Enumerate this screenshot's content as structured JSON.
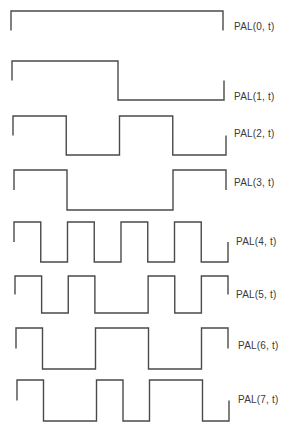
{
  "figure": {
    "background": "#ffffff",
    "line_color": "#4a4a4a",
    "label_color": "#3a3a3a"
  },
  "waveforms": [
    {
      "label": "PAL(0, t)",
      "bits": [
        1,
        1,
        1,
        1,
        1,
        1,
        1,
        1
      ],
      "x0": 11,
      "x1": 223,
      "high": 11,
      "low": 50,
      "label_x": 234,
      "label_y": 21
    },
    {
      "label": "PAL(1, t)",
      "bits": [
        1,
        1,
        1,
        1,
        -1,
        -1,
        -1,
        -1
      ],
      "x0": 12,
      "x1": 224,
      "high": 61,
      "low": 100,
      "label_x": 234,
      "label_y": 91
    },
    {
      "label": "PAL(2, t)",
      "bits": [
        1,
        1,
        -1,
        -1,
        1,
        1,
        -1,
        -1
      ],
      "x0": 13,
      "x1": 226,
      "high": 116,
      "low": 155,
      "label_x": 234,
      "label_y": 128
    },
    {
      "label": "PAL(3, t)",
      "bits": [
        1,
        1,
        -1,
        -1,
        -1,
        -1,
        1,
        1
      ],
      "x0": 14,
      "x1": 226,
      "high": 170,
      "low": 210,
      "label_x": 234,
      "label_y": 177
    },
    {
      "label": "PAL(4, t)",
      "bits": [
        1,
        -1,
        1,
        -1,
        1,
        -1,
        1,
        -1
      ],
      "x0": 14,
      "x1": 228,
      "high": 222,
      "low": 262,
      "label_x": 236,
      "label_y": 236
    },
    {
      "label": "PAL(5, t)",
      "bits": [
        1,
        -1,
        1,
        -1,
        -1,
        1,
        -1,
        1
      ],
      "x0": 15,
      "x1": 228,
      "high": 276,
      "low": 313,
      "label_x": 236,
      "label_y": 289
    },
    {
      "label": "PAL(6, t)",
      "bits": [
        1,
        -1,
        -1,
        1,
        1,
        -1,
        -1,
        1
      ],
      "x0": 16,
      "x1": 228,
      "high": 328,
      "low": 369,
      "label_x": 238,
      "label_y": 340
    },
    {
      "label": "PAL(7, t)",
      "bits": [
        1,
        -1,
        -1,
        1,
        -1,
        1,
        1,
        -1
      ],
      "x0": 17,
      "x1": 229,
      "high": 380,
      "low": 421,
      "label_x": 238,
      "label_y": 394
    }
  ]
}
